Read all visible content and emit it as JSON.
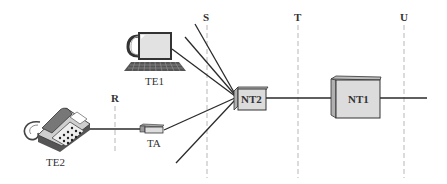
{
  "diagram": {
    "type": "ISDN reference configuration",
    "reference_points": [
      {
        "id": "S",
        "label": "S"
      },
      {
        "id": "T",
        "label": "T"
      },
      {
        "id": "U",
        "label": "U"
      },
      {
        "id": "R",
        "label": "R"
      }
    ],
    "devices": {
      "te1": {
        "label": "TE1",
        "kind": "computer"
      },
      "te2": {
        "label": "TE2",
        "kind": "telephone"
      },
      "ta": {
        "label": "TA",
        "kind": "terminal adapter"
      },
      "nt2": {
        "label": "NT2",
        "kind": "network termination 2"
      },
      "nt1": {
        "label": "NT1",
        "kind": "network termination 1"
      }
    },
    "connections": [
      {
        "from": "TE2",
        "to": "TA",
        "via": "R"
      },
      {
        "from": "TA",
        "to": "NT2",
        "via": "S"
      },
      {
        "from": "TE1",
        "to": "NT2",
        "via": "S"
      },
      {
        "from": "NT2",
        "to": "NT1",
        "via": "T"
      },
      {
        "from": "NT1",
        "to": "network",
        "via": "U"
      }
    ],
    "colors": {
      "line": "#2a2a2a",
      "reference_line": "#c8c8c8",
      "box_fill": "#dcdcdc",
      "box_side": "#b8b8b8"
    }
  }
}
